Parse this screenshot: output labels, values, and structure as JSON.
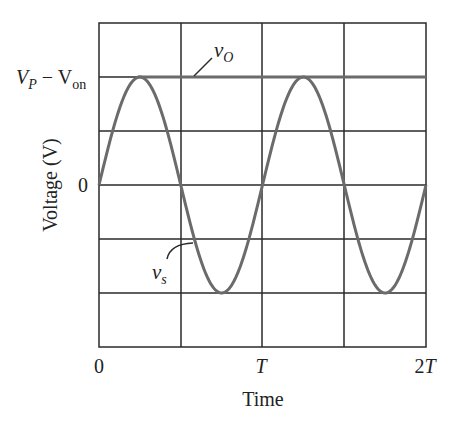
{
  "chart_data": {
    "type": "line",
    "title": "",
    "xlabel": "Time",
    "ylabel": "Voltage (V)",
    "x_ticks": [
      "0",
      "T",
      "2T"
    ],
    "y_ticks": [
      "V_P − V_on",
      "0"
    ],
    "grid": true,
    "grid_columns": 4,
    "grid_rows": 6,
    "series": [
      {
        "name": "v_s",
        "description": "sinusoidal source voltage, amplitude V_P - V_on (relative), two periods from 0 to 2T",
        "x": [
          "0",
          "T/4",
          "T/2",
          "3T/4",
          "T",
          "5T/4",
          "3T/2",
          "7T/4",
          "2T"
        ],
        "values": [
          0,
          1,
          0,
          -1,
          0,
          1,
          0,
          -1,
          0
        ]
      },
      {
        "name": "v_O",
        "description": "output voltage, holds at peak V_P - V_on after first peak at T/4",
        "x": [
          "T/4",
          "2T"
        ],
        "values": [
          1,
          1
        ]
      }
    ],
    "annotations": [
      "v_O",
      "v_s"
    ]
  },
  "labels": {
    "y_top_main": "V",
    "y_top_sub1": "P",
    "y_top_minus": " − V",
    "y_top_sub2": "on",
    "y_zero": "0",
    "x_zero": "0",
    "x_T": "T",
    "x_2T_num": "2",
    "x_2T_T": "T",
    "xlabel": "Time",
    "ylabel": "Voltage (V)",
    "vo_main": "v",
    "vo_sub": "O",
    "vs_main": "v",
    "vs_sub": "s"
  },
  "colors": {
    "grid": "#2a2a2a",
    "curve": "#6b6b6b"
  }
}
